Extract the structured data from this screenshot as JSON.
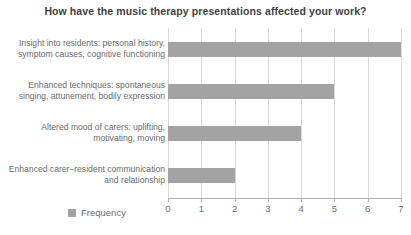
{
  "chart_data": {
    "type": "bar",
    "orientation": "horizontal",
    "title": "How have the music therapy presentations affected your work?",
    "xlabel": "",
    "ylabel": "",
    "xlim": [
      0,
      7
    ],
    "xticks": [
      "0",
      "1",
      "2",
      "3",
      "4",
      "5",
      "6",
      "7"
    ],
    "grid": true,
    "legend_position": "bottom-left",
    "legend": [
      "Frequency"
    ],
    "categories": [
      "Insight into residents: personal history, symptom causes, cognitive functioning",
      "Enhanced techniques: spontaneous singing, attunement, bodily expression",
      "Altered mood of carers: uplifting, motivating, moving",
      "Enhanced carer–resident communication and relationship"
    ],
    "series": [
      {
        "name": "Frequency",
        "values": [
          7,
          5,
          4,
          2
        ],
        "color": "#a3a3a3"
      }
    ]
  },
  "legend": {
    "frequency_label": "Frequency"
  },
  "colors": {
    "bar": "#a3a3a3",
    "grid": "#d9d9d9",
    "axis": "#b0b0b0",
    "title_text": "#3f3f3f",
    "label_text": "#6b6b6b",
    "background": "#ffffff"
  }
}
